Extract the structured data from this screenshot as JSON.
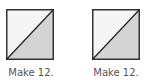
{
  "figures": [
    {
      "caption": "Make 12.",
      "shape": "square-split-diagonal",
      "top_left_fill": "#f5f5f5",
      "bottom_right_fill": "#d4d4d4",
      "stroke": "#333333"
    },
    {
      "caption": "Make 12.",
      "shape": "square-split-diagonal",
      "top_left_fill": "#f5f5f5",
      "bottom_right_fill": "#d4d4d4",
      "stroke": "#333333"
    }
  ]
}
